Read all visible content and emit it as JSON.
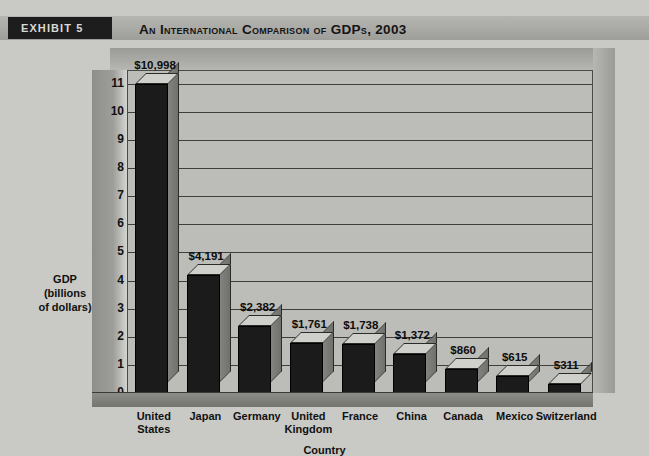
{
  "header": {
    "exhibit_tag": "EXHIBIT 5",
    "title": "An International Comparison of GDPs, 2003",
    "tag_bg": "#1d1d1d",
    "band_bg": "#a9a9a6"
  },
  "chart_data": {
    "type": "bar",
    "title": "An International Comparison of GDPs, 2003",
    "categories": [
      "United States",
      "Japan",
      "Germany",
      "United Kingdom",
      "France",
      "China",
      "Canada",
      "Mexico",
      "Switzerland"
    ],
    "values": [
      10998,
      4191,
      2382,
      1761,
      1738,
      1372,
      860,
      615,
      311
    ],
    "data_labels": [
      "$10,998",
      "$4,191",
      "$2,382",
      "$1,761",
      "$1,738",
      "$1,372",
      "$860",
      "$615",
      "$311"
    ],
    "xlabel": "Country",
    "ylabel": "GDP\n(billions\nof dollars)",
    "ylabel_lines": [
      "GDP",
      "(billions",
      "of dollars)"
    ],
    "ytick_labels": [
      "0",
      "1",
      "2",
      "3",
      "4",
      "5",
      "6",
      "7",
      "8",
      "9",
      "10",
      "11"
    ],
    "ytick_values": [
      0,
      1,
      2,
      3,
      4,
      5,
      6,
      7,
      8,
      9,
      10,
      11
    ],
    "ylim": [
      0,
      11.45
    ],
    "y_unit_note": "thousands of billions of dollars (axis in units of 1,000)",
    "grid": true,
    "legend": null,
    "style": "3d-column",
    "bar_front_color": "#1b1b1b",
    "bar_top_color": "#cfcfcc",
    "bar_side_color": "#83837f",
    "plot_bg": "#bcbcb9",
    "gridline_color": "#3e3e3b"
  }
}
